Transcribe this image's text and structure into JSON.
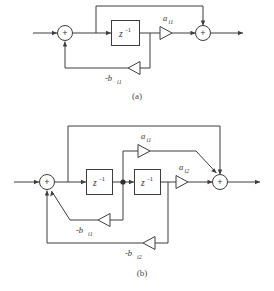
{
  "figure": {
    "type": "signal-flow-block-diagram",
    "background_color": "#ffffff",
    "line_color": "#3d3d3d",
    "text_color": "#333333"
  },
  "panel_a": {
    "caption": "(a)",
    "delay_block_label": "z",
    "delay_block_exponent": "-1",
    "summer_symbol": "+",
    "gain_forward": {
      "base": "a",
      "subscript": "i1"
    },
    "gain_feedback": {
      "base": "-b",
      "subscript": "i1"
    },
    "summers": 2,
    "delay_blocks": 1,
    "gain_triangles": 2
  },
  "panel_b": {
    "caption": "(b)",
    "delay_block_label": "z",
    "delay_block_exponent": "-1",
    "summer_symbol": "+",
    "gain_forward_1": {
      "base": "a",
      "subscript": "i1"
    },
    "gain_forward_2": {
      "base": "a",
      "subscript": "i2"
    },
    "gain_feedback_1": {
      "base": "-b",
      "subscript": "i1"
    },
    "gain_feedback_2": {
      "base": "-b",
      "subscript": "i2"
    },
    "summers": 2,
    "delay_blocks": 2,
    "gain_triangles": 4,
    "junction_dots": 1
  },
  "footer": {
    "text": ""
  }
}
